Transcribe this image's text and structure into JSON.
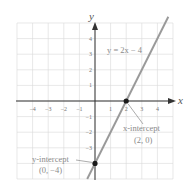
{
  "chart_data": {
    "type": "line",
    "title": "",
    "xlabel": "x",
    "ylabel": "y",
    "xlim": [
      -5,
      5
    ],
    "ylim": [
      -5,
      5
    ],
    "grid": true,
    "x_ticks": [
      -4,
      -3,
      -2,
      -1,
      1,
      2,
      3,
      4
    ],
    "y_ticks": [
      4,
      3,
      2,
      1,
      -1,
      -2,
      -3
    ],
    "series": [
      {
        "name": "y = 2x − 4",
        "equation": "y = 2x − 4",
        "slope": 2,
        "intercept": -4,
        "x": [
          -0.5,
          4.7
        ],
        "y": [
          -5,
          5.4
        ],
        "color": "#9a9a9a"
      }
    ],
    "points": [
      {
        "label": "x-intercept",
        "coords": "(2, 0)",
        "x": 2,
        "y": 0
      },
      {
        "label": "y-intercept",
        "coords": "(0, −4)",
        "x": 0,
        "y": -4
      }
    ],
    "annotations": {
      "equation_label": "y = 2x − 4",
      "x_intercept_label": "x-intercept",
      "x_intercept_coords": "(2, 0)",
      "y_intercept_label": "y-intercept",
      "y_intercept_coords": "(0, −4)"
    }
  },
  "colors": {
    "grid": "#d8d8d8",
    "axis": "#333333",
    "line": "#9a9a9a",
    "point": "#1a1a1a",
    "text": "#8a8a8a"
  }
}
